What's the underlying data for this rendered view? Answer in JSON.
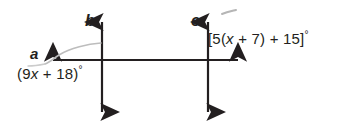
{
  "figure": {
    "background_color": "#ffffff",
    "stroke_color": "#231f20",
    "pencil_mark_color": "#b8b8b8",
    "lines": [
      {
        "name": "b",
        "orientation": "vertical",
        "x": 102,
        "label": "b"
      },
      {
        "name": "c",
        "orientation": "vertical",
        "x": 208,
        "label": "c"
      },
      {
        "name": "transversal",
        "orientation": "horizontal",
        "y": 60,
        "label": ""
      }
    ],
    "labels": {
      "line_b": "b",
      "line_c": "c",
      "angle_a": "a",
      "expression_left": "(9x + 18)°",
      "expression_right": "[5(x + 7) + 15]°"
    },
    "expression_left_parts": {
      "open": "(",
      "coefficient": "9",
      "variable": "x",
      "operator": " + ",
      "constant": "18",
      "close": ")",
      "degree": "°"
    },
    "expression_right_parts": {
      "open": "[5(",
      "variable": "x",
      "operator_inner": " + ",
      "inner_constant": "7",
      "close_inner": ")",
      "operator_outer": " + ",
      "outer_constant": "15",
      "close": "]",
      "degree": "°"
    },
    "annotations": [
      {
        "name": "pencil-curve-to-angle-a",
        "description": "light gray hand-drawn curve pointing to angle a"
      },
      {
        "name": "pencil-tick-near-c",
        "description": "small gray stray pencil tick right of line c"
      }
    ]
  }
}
